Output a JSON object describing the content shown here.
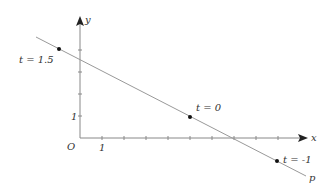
{
  "figure": {
    "axes": {
      "x_label": "x",
      "y_label": "y",
      "origin_label": "O",
      "x_unit_label": "1",
      "y_unit_label": "1",
      "origin_px": [
        80,
        138
      ],
      "unit_px": 22,
      "x_ticks": [
        1,
        2,
        3,
        4,
        5,
        6,
        7,
        8,
        9
      ],
      "y_ticks": [
        1,
        2,
        3,
        4
      ]
    },
    "line": {
      "label": "p",
      "color": "#999999",
      "equation": "(x, y) = (5, 1) + t(-4, 2)"
    },
    "points": [
      {
        "label": "t = 1.5",
        "t": 1.5,
        "x": -1,
        "y": 4
      },
      {
        "label": "t = 0",
        "t": 0,
        "x": 5,
        "y": 1
      },
      {
        "label": "t = -1",
        "t": -1,
        "x": 9,
        "y": -1
      }
    ],
    "colors": {
      "axis": "#888888",
      "line": "#999999",
      "point": "#111111",
      "text": "#333333"
    }
  }
}
